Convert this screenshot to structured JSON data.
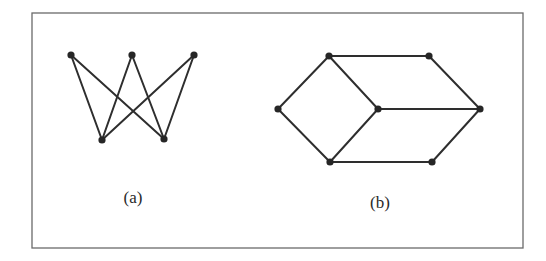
{
  "figure": {
    "frame": {
      "x": 32,
      "y": 13,
      "width": 491,
      "height": 235
    },
    "colors": {
      "edge": "#2e2e2e",
      "node": "#262626",
      "frame": "#6a6a6a",
      "background": "#ffffff"
    },
    "graphs": [
      {
        "id": "a",
        "label": "(a)",
        "label_pos": {
          "x": 133,
          "y": 203
        },
        "nodes": [
          {
            "id": "a1",
            "x": 71,
            "y": 55
          },
          {
            "id": "a2",
            "x": 132,
            "y": 55
          },
          {
            "id": "a3",
            "x": 194,
            "y": 55
          },
          {
            "id": "b1",
            "x": 102,
            "y": 140
          },
          {
            "id": "b2",
            "x": 164,
            "y": 139
          }
        ],
        "edges": [
          [
            "a1",
            "b1"
          ],
          [
            "a1",
            "b2"
          ],
          [
            "a2",
            "b1"
          ],
          [
            "a2",
            "b2"
          ],
          [
            "a3",
            "b1"
          ],
          [
            "a3",
            "b2"
          ]
        ]
      },
      {
        "id": "b",
        "label": "(b)",
        "label_pos": {
          "x": 380,
          "y": 208
        },
        "nodes": [
          {
            "id": "tl",
            "x": 329,
            "y": 56
          },
          {
            "id": "tr",
            "x": 429,
            "y": 56
          },
          {
            "id": "l",
            "x": 278,
            "y": 109
          },
          {
            "id": "c",
            "x": 378,
            "y": 109
          },
          {
            "id": "r",
            "x": 480,
            "y": 109
          },
          {
            "id": "bl",
            "x": 330,
            "y": 162
          },
          {
            "id": "br",
            "x": 432,
            "y": 162
          }
        ],
        "edges": [
          [
            "tl",
            "tr"
          ],
          [
            "tl",
            "l"
          ],
          [
            "tl",
            "c"
          ],
          [
            "tr",
            "r"
          ],
          [
            "l",
            "bl"
          ],
          [
            "c",
            "r"
          ],
          [
            "c",
            "bl"
          ],
          [
            "r",
            "br"
          ],
          [
            "bl",
            "br"
          ]
        ]
      }
    ]
  }
}
